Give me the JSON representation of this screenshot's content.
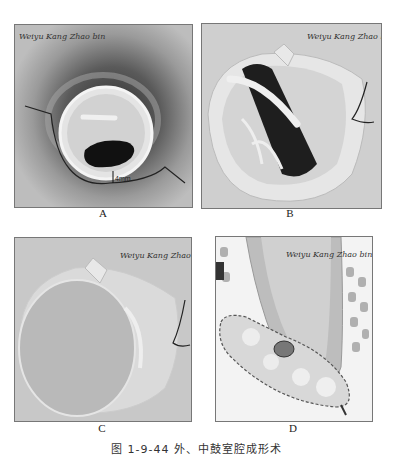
{
  "figure": {
    "caption": "图 1-9-44  外、中鼓室腔成形术",
    "panels": [
      {
        "id": "A",
        "label": "A",
        "signature": "Weiyu Kang Zhao bin",
        "annotation": "4mm"
      },
      {
        "id": "B",
        "label": "B",
        "signature": "Weiyu Kang Zhao bin"
      },
      {
        "id": "C",
        "label": "C",
        "signature": "Weiyu Kang Zhao bin"
      },
      {
        "id": "D",
        "label": "D",
        "signature": "Weiyu Kang Zhao bin"
      }
    ]
  }
}
